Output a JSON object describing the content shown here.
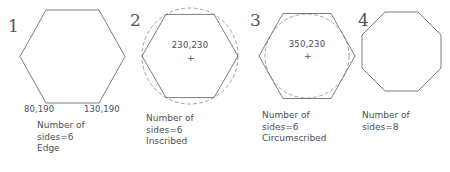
{
  "diagram": {
    "stroke_color": "#6d6d6d",
    "guide_color": "#8a8a8a",
    "text_color": "#4f4f4f",
    "background": "#ffffff"
  },
  "figures": [
    {
      "index": "1",
      "shape": "hexagon",
      "orientation": "flat-top",
      "method": "Edge",
      "guide": "none",
      "vertex_labels": [
        "80,190",
        "130,190"
      ],
      "center_label": "",
      "caption": [
        "Number of",
        "sides=6",
        "Edge"
      ],
      "caption_lines": {
        "line1": "Number of",
        "line2": "sides=6",
        "line3": "Edge"
      }
    },
    {
      "index": "2",
      "shape": "hexagon",
      "orientation": "flat-top",
      "method": "Inscribed",
      "guide": "dashed-circle",
      "vertex_labels": [],
      "center_label": "230,230",
      "center_mark": "+",
      "caption": [
        "Number of",
        "sides=6",
        "Inscribed"
      ],
      "caption_lines": {
        "line1": "Number of",
        "line2": "sides=6",
        "line3": "Inscribed"
      }
    },
    {
      "index": "3",
      "shape": "hexagon",
      "orientation": "flat-top",
      "method": "Circumscribed",
      "guide": "dashed-circle",
      "vertex_labels": [],
      "center_label": "350,230",
      "center_mark": "+",
      "caption": [
        "Number of",
        "sides=6",
        "Circumscribed"
      ],
      "caption_lines": {
        "line1": "Number of",
        "line2": "sides=6",
        "line3": "Circumscribed"
      }
    },
    {
      "index": "4",
      "shape": "octagon",
      "orientation": "flat-top",
      "method": "",
      "guide": "none",
      "vertex_labels": [],
      "center_label": "",
      "caption": [
        "Number of",
        "sides=8"
      ],
      "caption_lines": {
        "line1": "Number of",
        "line2": "sides=8",
        "line3": ""
      }
    }
  ]
}
